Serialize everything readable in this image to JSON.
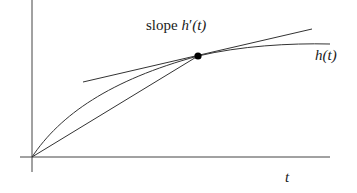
{
  "diagram": {
    "type": "function-graph-with-tangent",
    "labels": {
      "slope_prefix": "slope ",
      "slope_fn": "h",
      "slope_prime": "′",
      "slope_arg": "(t)",
      "curve_fn": "h",
      "curve_arg": "(t)",
      "x_axis": "t"
    },
    "colors": {
      "line": "#333333",
      "point": "#000000",
      "background": "#ffffff"
    },
    "elements": [
      "y-axis",
      "x-axis",
      "curve h(t)",
      "tangent line at point",
      "secant line from origin to point",
      "marked point"
    ]
  }
}
